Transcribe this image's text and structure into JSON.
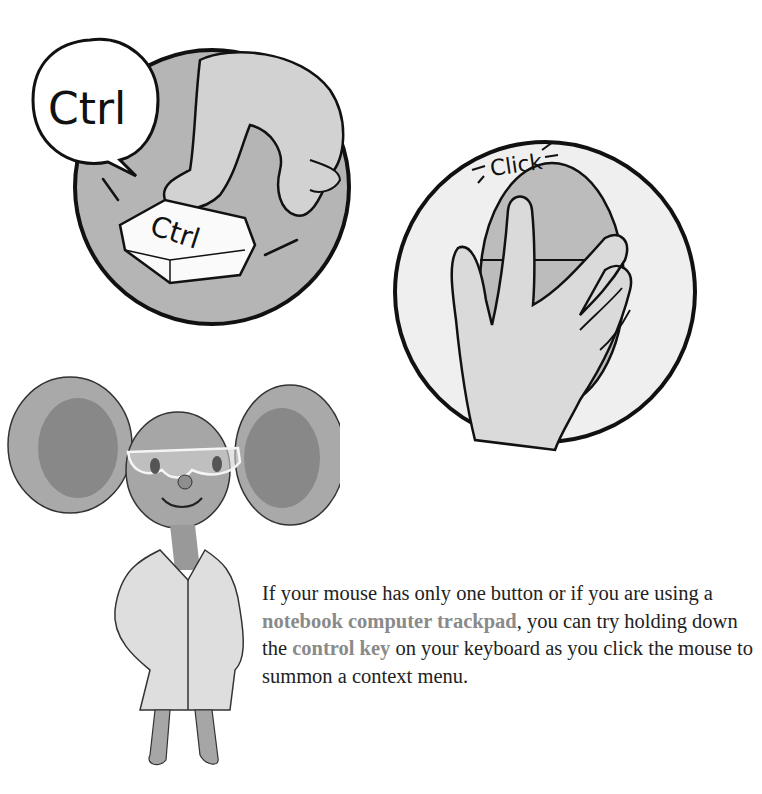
{
  "illustrations": {
    "keyboard_panel": {
      "speech_bubble_text": "Ctrl",
      "key_label": "Ctrl",
      "description": "finger pressing Ctrl key"
    },
    "mouse_panel": {
      "sound_effect": "Click",
      "description": "hand clicking a one-button mouse"
    },
    "character": {
      "description": "mouse scientist in lab coat and goggles"
    }
  },
  "caption": {
    "part1": "If your mouse has only one button or if you are using a ",
    "highlight1": "notebook computer trackpad",
    "part2": ", you can try holding down the ",
    "highlight2": "control key",
    "part3": " on your keyboard as you click the mouse to summon a context menu."
  },
  "colors": {
    "highlight": "#8a8a8a",
    "body_text": "#222222",
    "panel_gray": "#b4b4b4",
    "panel_light": "#efefef",
    "outline": "#111111"
  }
}
